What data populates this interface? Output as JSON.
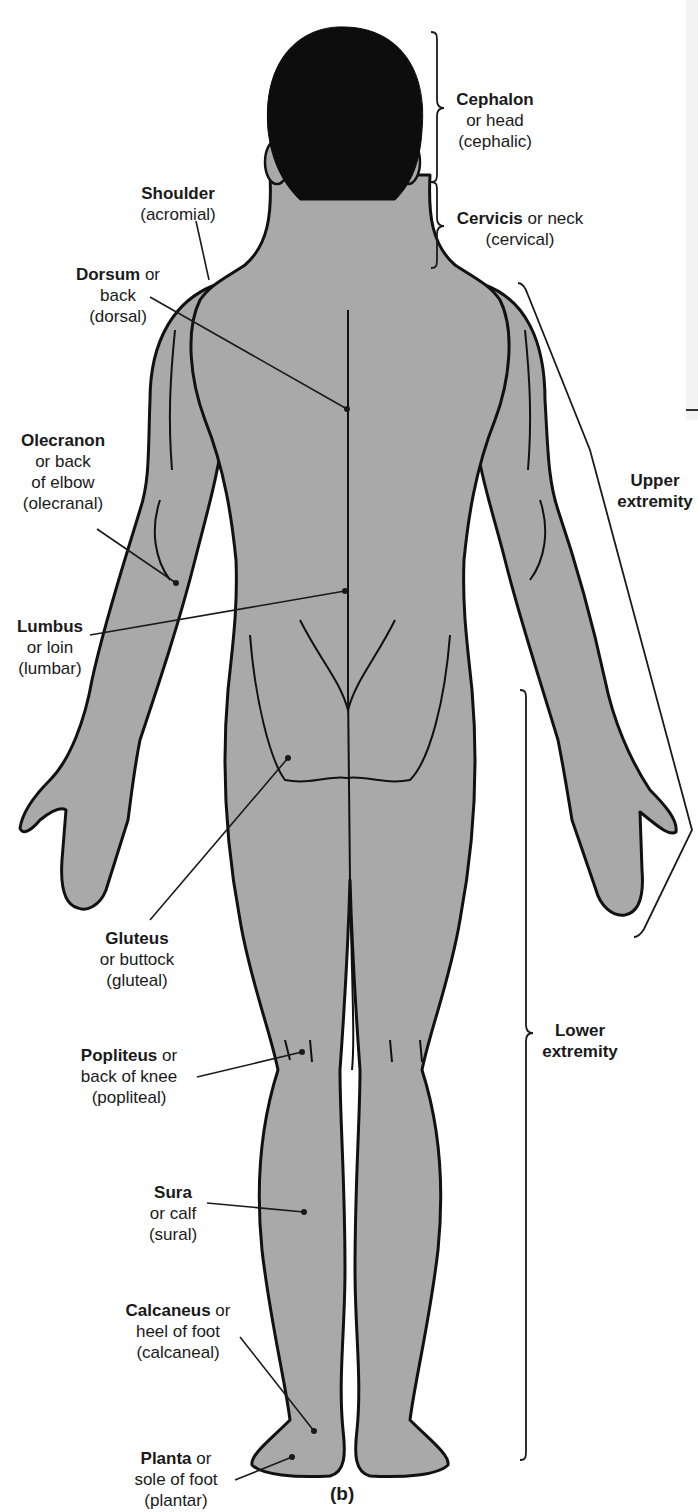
{
  "figure": {
    "caption": "(b)",
    "view": "posterior",
    "body_fill": "#a9a9a9",
    "outline_color": "#111111",
    "hair_color": "#0d0d0d",
    "leader_color": "#1a1a1a"
  },
  "labels": [
    {
      "id": "shoulder",
      "term": "Shoulder",
      "suffix": "",
      "lines": [
        "(acromial)"
      ],
      "x": 178,
      "y": 183,
      "anchor": [
        209,
        280
      ],
      "dot": false,
      "from": [
        196,
        221
      ]
    },
    {
      "id": "dorsum",
      "term": "Dorsum",
      "suffix": " or",
      "lines": [
        "back",
        "(dorsal)"
      ],
      "x": 118,
      "y": 264,
      "anchor": [
        347,
        409
      ],
      "dot": true,
      "from": [
        150,
        297
      ]
    },
    {
      "id": "olecranon",
      "term": "Olecranon",
      "suffix": "",
      "lines": [
        "or back",
        "of elbow",
        "(olecranal)"
      ],
      "x": 63,
      "y": 430,
      "anchor": [
        176,
        583
      ],
      "dot": true,
      "from": [
        97,
        529
      ]
    },
    {
      "id": "lumbus",
      "term": "Lumbus",
      "suffix": "",
      "lines": [
        "or loin",
        "(lumbar)"
      ],
      "x": 50,
      "y": 616,
      "anchor": [
        345,
        591
      ],
      "dot": true,
      "from": [
        90,
        635
      ]
    },
    {
      "id": "gluteus",
      "term": "Gluteus",
      "suffix": "",
      "lines": [
        "or buttock",
        "(gluteal)"
      ],
      "x": 137,
      "y": 928,
      "anchor": [
        288,
        758
      ],
      "dot": true,
      "from": [
        150,
        920
      ]
    },
    {
      "id": "popliteus",
      "term": "Popliteus",
      "suffix": " or",
      "lines": [
        "back of knee",
        "(popliteal)"
      ],
      "x": 129,
      "y": 1045,
      "anchor": [
        302,
        1052
      ],
      "dot": true,
      "from": [
        197,
        1077
      ]
    },
    {
      "id": "sura",
      "term": "Sura",
      "suffix": "",
      "lines": [
        "or calf",
        "(sural)"
      ],
      "x": 173,
      "y": 1182,
      "anchor": [
        304,
        1212
      ],
      "dot": true,
      "from": [
        207,
        1203
      ]
    },
    {
      "id": "calcaneus",
      "term": "Calcaneus",
      "suffix": " or",
      "lines": [
        "heel of foot",
        "(calcaneal)"
      ],
      "x": 178,
      "y": 1300,
      "anchor": [
        314,
        1431
      ],
      "dot": true,
      "from": [
        240,
        1337
      ]
    },
    {
      "id": "planta",
      "term": "Planta",
      "suffix": " or",
      "lines": [
        "sole of foot",
        "(plantar)"
      ],
      "x": 176,
      "y": 1448,
      "anchor": [
        292,
        1457
      ],
      "dot": true,
      "from": [
        235,
        1480
      ]
    },
    {
      "id": "cephalon",
      "term": "Cephalon",
      "suffix": "",
      "lines": [
        "or head",
        "(cephalic)"
      ],
      "x": 495,
      "y": 89,
      "anchor": null,
      "dot": false,
      "from": null
    },
    {
      "id": "cervicis",
      "term": "Cervicis",
      "suffix": " or neck",
      "lines": [
        "(cervical)"
      ],
      "x": 520,
      "y": 208,
      "anchor": null,
      "dot": false,
      "from": null
    }
  ],
  "regions": [
    {
      "id": "upper-extremity",
      "lines": [
        "Upper",
        "extremity"
      ],
      "x": 655,
      "y": 470
    },
    {
      "id": "lower-extremity",
      "lines": [
        "Lower",
        "extremity"
      ],
      "x": 580,
      "y": 1020
    }
  ],
  "brackets": [
    {
      "id": "head-bracket",
      "x": 437,
      "y1": 32,
      "y2": 182,
      "mid": 108
    },
    {
      "id": "neck-bracket",
      "x": 437,
      "y1": 182,
      "y2": 268,
      "mid": 226
    },
    {
      "id": "lower-extremity-bracket",
      "x": 526,
      "y1": 690,
      "y2": 1460,
      "mid": 1033
    }
  ],
  "upper_bracket": {
    "top": [
      518,
      283
    ],
    "mid": [
      590,
      450
    ],
    "tip": [
      692,
      830
    ],
    "bottom": [
      638,
      937
    ]
  }
}
